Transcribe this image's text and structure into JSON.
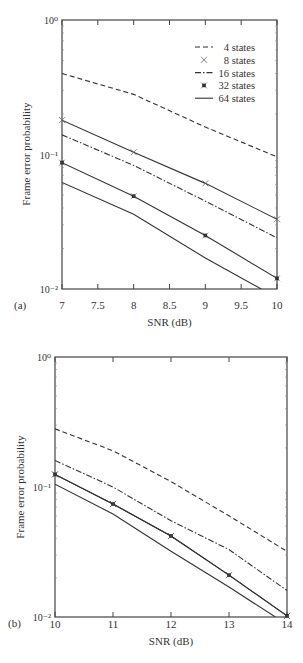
{
  "chart_data": [
    {
      "panel_label": "(a)",
      "type": "line",
      "title": "",
      "xlabel": "SNR (dB)",
      "ylabel": "Frame error probability",
      "yscale": "log",
      "xlim": [
        7,
        10
      ],
      "ylim": [
        0.01,
        1
      ],
      "xticks": [
        "7",
        "7.5",
        "8",
        "8.5",
        "9",
        "9.5",
        "10"
      ],
      "yticks": [
        "10⁰",
        "10⁻¹",
        "10⁻²"
      ],
      "grid": false,
      "legend_position": "upper right",
      "series": [
        {
          "name": "4 states",
          "style": "dashed",
          "marker": "",
          "x": [
            7,
            8,
            9,
            10
          ],
          "values": [
            0.4,
            0.28,
            0.16,
            0.096
          ]
        },
        {
          "name": "8 states",
          "style": "solid",
          "marker": "x",
          "x": [
            7,
            8,
            9,
            10
          ],
          "values": [
            0.18,
            0.104,
            0.061,
            0.033
          ]
        },
        {
          "name": "16 states",
          "style": "dashdot",
          "marker": "",
          "x": [
            7,
            8,
            9,
            10
          ],
          "values": [
            0.14,
            0.083,
            0.045,
            0.024
          ]
        },
        {
          "name": "32 states",
          "style": "solid",
          "marker": "*",
          "x": [
            7,
            8,
            9,
            10
          ],
          "values": [
            0.087,
            0.049,
            0.025,
            0.012
          ]
        },
        {
          "name": "64 states",
          "style": "solid",
          "marker": "",
          "x": [
            7,
            8,
            9,
            9.78
          ],
          "values": [
            0.062,
            0.036,
            0.017,
            0.01
          ]
        }
      ]
    },
    {
      "panel_label": "(b)",
      "type": "line",
      "title": "",
      "xlabel": "SNR (dB)",
      "ylabel": "Frame error probability",
      "yscale": "log",
      "xlim": [
        10,
        14
      ],
      "ylim": [
        0.01,
        1
      ],
      "xticks": [
        "10",
        "11",
        "12",
        "13",
        "14"
      ],
      "yticks": [
        "10⁰",
        "10⁻¹",
        "10⁻²"
      ],
      "grid": false,
      "series": [
        {
          "name": "4 states",
          "style": "dashed",
          "marker": "",
          "x": [
            10,
            11,
            12,
            13,
            14
          ],
          "values": [
            0.28,
            0.19,
            0.11,
            0.06,
            0.032
          ]
        },
        {
          "name": "8 states",
          "style": "solid",
          "marker": "x",
          "x": [
            10,
            11,
            12,
            13,
            14
          ],
          "values": [
            0.125,
            0.074,
            0.042,
            0.021,
            0.0102
          ]
        },
        {
          "name": "16 states",
          "style": "dashdot",
          "marker": "",
          "x": [
            10,
            11,
            12,
            13,
            14
          ],
          "values": [
            0.16,
            0.1,
            0.055,
            0.033,
            0.016
          ]
        },
        {
          "name": "32 states",
          "style": "solid",
          "marker": "*",
          "x": [
            10,
            11,
            12,
            13,
            14
          ],
          "values": [
            0.125,
            0.074,
            0.042,
            0.021,
            0.0102
          ]
        },
        {
          "name": "64 states",
          "style": "solid",
          "marker": "",
          "x": [
            10,
            11,
            12,
            13,
            13.8
          ],
          "values": [
            0.105,
            0.062,
            0.032,
            0.017,
            0.01
          ]
        }
      ]
    }
  ]
}
